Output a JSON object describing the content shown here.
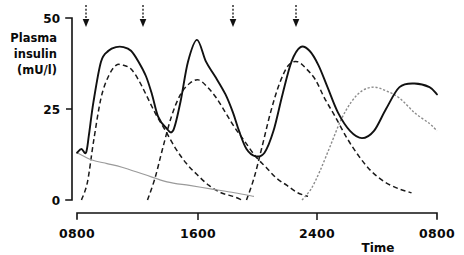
{
  "chart_data": {
    "type": "line",
    "title": "",
    "xlabel": "Time",
    "ylabel": "Plasma insulin (mU/l)",
    "ylabel_lines": [
      "Plasma",
      "insulin",
      "(mU/l)"
    ],
    "ylim": [
      0,
      50
    ],
    "yticks": [
      0,
      25,
      50
    ],
    "ytick_labels": [
      "0",
      "25",
      "50"
    ],
    "xlim_labels": [
      "0800",
      "1600",
      "2400",
      "0800"
    ],
    "xticks": [
      800,
      1600,
      2400,
      3200
    ],
    "xtick_labels": [
      "0800",
      "1600",
      "2400",
      "0800"
    ],
    "grid": false,
    "legend": "none",
    "annotations": [
      {
        "name": "injection-arrow-1",
        "x": 860,
        "label": "injection"
      },
      {
        "name": "injection-arrow-2",
        "x": 1240,
        "label": "injection"
      },
      {
        "name": "injection-arrow-3",
        "x": 1840,
        "label": "injection"
      },
      {
        "name": "injection-arrow-4",
        "x": 2260,
        "label": "injection"
      }
    ],
    "series": [
      {
        "name": "total-plasma-insulin",
        "style": "solid",
        "x": [
          800,
          830,
          860,
          880,
          910,
          960,
          1010,
          1060,
          1110,
          1160,
          1210,
          1260,
          1300,
          1340,
          1390,
          1440,
          1490,
          1540,
          1600,
          1660,
          1720,
          1790,
          1840,
          1880,
          1930,
          1990,
          2050,
          2110,
          2170,
          2230,
          2290,
          2350,
          2410,
          2470,
          2540,
          2620,
          2700,
          2780,
          2860,
          2950,
          3050,
          3150,
          3200
        ],
        "values": [
          13,
          14,
          13,
          18,
          27,
          38,
          41,
          42,
          42,
          41,
          38,
          34,
          29,
          23,
          20,
          19,
          27,
          38,
          44,
          38,
          34,
          29,
          24,
          19,
          14,
          12,
          13,
          19,
          29,
          38,
          42,
          41,
          37,
          31,
          24,
          19,
          17,
          19,
          25,
          31,
          32,
          31,
          29
        ]
      },
      {
        "name": "morning-dose-component",
        "style": "dashed",
        "x": [
          830,
          870,
          910,
          960,
          1010,
          1060,
          1110,
          1160,
          1210,
          1260,
          1320,
          1390,
          1460,
          1530,
          1600,
          1680,
          1760,
          1840,
          1900
        ],
        "values": [
          0,
          5,
          16,
          28,
          34,
          37,
          37,
          36,
          33,
          29,
          24,
          19,
          14,
          10,
          7,
          4,
          2,
          1,
          0
        ]
      },
      {
        "name": "midday-dose-component",
        "style": "dashed",
        "x": [
          1270,
          1320,
          1370,
          1430,
          1490,
          1550,
          1610,
          1670,
          1730,
          1790,
          1850,
          1920,
          1990,
          2060,
          2130,
          2200,
          2270,
          2340
        ],
        "values": [
          0,
          6,
          14,
          23,
          29,
          32,
          33,
          31,
          28,
          24,
          20,
          16,
          12,
          9,
          6,
          4,
          2,
          1
        ]
      },
      {
        "name": "evening-dose-component",
        "style": "dashed",
        "x": [
          1930,
          1980,
          2030,
          2090,
          2150,
          2210,
          2270,
          2330,
          2390,
          2450,
          2520,
          2600,
          2680,
          2760,
          2850,
          2950,
          3030
        ],
        "values": [
          0,
          6,
          14,
          24,
          32,
          37,
          38,
          36,
          33,
          28,
          23,
          17,
          12,
          8,
          5,
          3,
          2
        ]
      },
      {
        "name": "overnight-dose-component",
        "style": "dotted",
        "x": [
          2300,
          2360,
          2420,
          2490,
          2560,
          2630,
          2700,
          2780,
          2860,
          2950,
          3050,
          3150,
          3200
        ],
        "values": [
          0,
          3,
          8,
          15,
          22,
          27,
          30,
          31,
          30,
          28,
          24,
          21,
          19
        ]
      },
      {
        "name": "residual-basal-component",
        "style": "thin-solid",
        "x": [
          800,
          900,
          1000,
          1100,
          1250,
          1400,
          1550,
          1700,
          1850,
          1980
        ],
        "values": [
          13,
          11,
          10,
          9,
          7,
          5,
          4,
          3,
          2,
          1
        ]
      }
    ]
  },
  "axes": {
    "y_label_lines": [
      "Plasma",
      "insulin",
      "(mU/l)"
    ],
    "y_tick_top": "50",
    "y_tick_mid": "25",
    "y_tick_bottom": "0",
    "x_tick_1": "0800",
    "x_tick_2": "1600",
    "x_tick_3": "2400",
    "x_tick_4": "0800",
    "x_axis_name": "Time"
  }
}
